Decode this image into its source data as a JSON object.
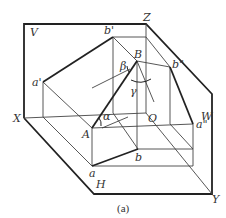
{
  "caption": "(a)",
  "labels": {
    "V": "V",
    "Z": "Z",
    "W": "W",
    "X": "X",
    "Y": "Y",
    "H": "H",
    "O": "O",
    "b_prime": "b'",
    "b_double_prime": "b\"",
    "a_prime": "a'",
    "a_double_prime": "a\"",
    "B": "B",
    "A": "A",
    "a": "a",
    "b": "b",
    "alpha": "α",
    "beta": "β",
    "gamma": "γ"
  },
  "colors": {
    "line": "#222222",
    "thin_line": "#444444",
    "text": "#333333"
  }
}
